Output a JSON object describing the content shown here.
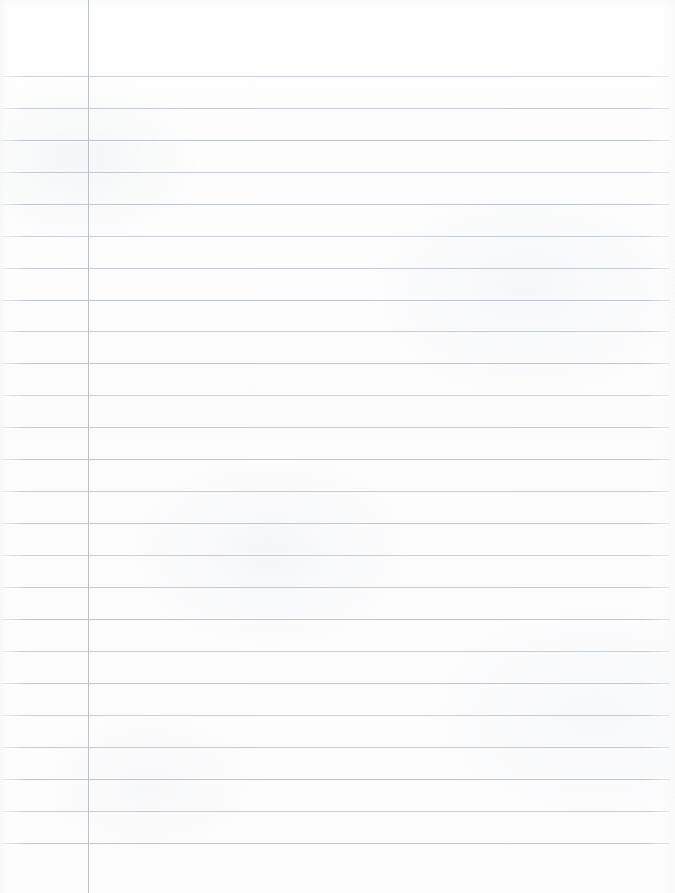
{
  "page": {
    "kind": "blank-ruled-page",
    "width": 675,
    "height": 893,
    "content_text": "",
    "has_handwriting": false
  },
  "paper": {
    "background_color": "#fdfdfd",
    "texture": "subtle mottled off-white paper grain",
    "edge_shading": {
      "left_band_color": "#f6f7f8",
      "right_band_color": "#f8f8f9",
      "top_band_color": "#f7f8f9"
    }
  },
  "ruling": {
    "line_color": "#b9bec4",
    "line_thickness_px": 1,
    "line_count": 25,
    "first_line_y": 76,
    "line_spacing_px": 32,
    "line_start_x": 0,
    "line_end_x": 670,
    "line_y_positions": [
      76,
      108,
      140,
      172,
      204,
      236,
      268,
      300,
      331,
      363,
      395,
      427,
      459,
      491,
      523,
      555,
      587,
      619,
      651,
      683,
      715,
      747,
      779,
      811,
      843
    ]
  },
  "margin": {
    "label": "left margin rule",
    "line_color": "#b5babf",
    "line_thickness_px": 1,
    "x_position": 88,
    "start_y": 0,
    "end_y": 893
  }
}
